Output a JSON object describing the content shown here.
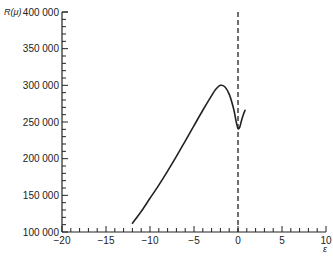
{
  "chart_data": {
    "type": "line",
    "title": "",
    "xlabel": "ε",
    "ylabel": "R(μ)",
    "xlim": [
      -20,
      10
    ],
    "ylim": [
      100000,
      400000
    ],
    "grid": false,
    "legend": null,
    "x_ticks": [
      -20,
      -15,
      -10,
      -5,
      0,
      5,
      10
    ],
    "x_tick_labels": [
      "−20",
      "−15",
      "−10",
      "−5",
      "0",
      "5",
      "10"
    ],
    "y_ticks": [
      100000,
      150000,
      200000,
      250000,
      300000,
      350000,
      400000
    ],
    "y_tick_labels": [
      "100 000",
      "150 000",
      "200 000",
      "250 000",
      "300 000",
      "350 000",
      "400 000"
    ],
    "series": [
      {
        "name": "R(μ)",
        "style": "solid",
        "x": [
          -12,
          -11,
          -10,
          -9,
          -8,
          -7,
          -6,
          -5,
          -4,
          -3,
          -2.5,
          -2,
          -1.5,
          -1,
          -0.5,
          -0.2,
          0,
          0.2,
          0.4,
          0.6,
          0.8
        ],
        "y": [
          112000,
          128000,
          146000,
          164000,
          183000,
          203000,
          224000,
          245000,
          266000,
          286000,
          295000,
          300000,
          298000,
          288000,
          268000,
          250000,
          241000,
          243000,
          252000,
          260000,
          266000
        ]
      }
    ],
    "annotations": [
      {
        "type": "vertical-dashed-line",
        "x": 0,
        "y_from": 100000,
        "y_to": 400000
      }
    ]
  }
}
